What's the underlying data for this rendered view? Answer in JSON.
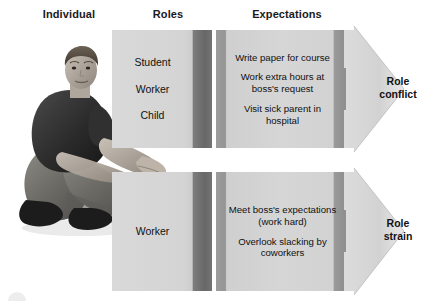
{
  "diagram": {
    "headers": {
      "individual": "Individual",
      "roles": "Roles",
      "expectations": "Expectations"
    },
    "colors": {
      "box_face": "#d6d6d6",
      "box_shadow_band": "#8e8e8e",
      "arrow_fill": "#d9d9d9",
      "text": "#111111",
      "background": "#ffffff"
    },
    "rows": [
      {
        "id": "role-conflict",
        "roles": [
          "Student",
          "Worker",
          "Child"
        ],
        "expectations": [
          "Write paper for course",
          "Work extra hours at boss's request",
          "Visit sick parent in hospital"
        ],
        "outcome": "Role conflict",
        "outcome_line1": "Role",
        "outcome_line2": "conflict"
      },
      {
        "id": "role-strain",
        "roles": [
          "Worker"
        ],
        "expectations": [
          "Meet boss's expectations (work hard)",
          "Overlook slacking by coworkers"
        ],
        "outcome": "Role strain",
        "outcome_line1": "Role",
        "outcome_line2": "strain"
      }
    ],
    "individual_photo_alt": "Man crouching, looking at camera"
  }
}
